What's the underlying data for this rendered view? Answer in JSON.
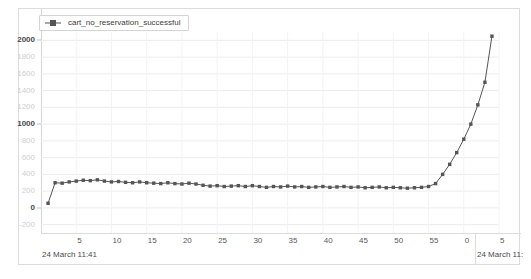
{
  "legend": {
    "position": "top-left",
    "entries": [
      {
        "label": "cart_no_reservation_successful",
        "color": "#555555",
        "marker": "square"
      }
    ]
  },
  "axes": {
    "y_ticks": [
      "2000",
      "1800",
      "1600",
      "1400",
      "1200",
      "1000",
      "800",
      "600",
      "400",
      "200",
      "0",
      "-200"
    ],
    "y_major_ticks": [
      "2000",
      "1000",
      "0"
    ],
    "x_ticks": [
      "5",
      "10",
      "15",
      "20",
      "25",
      "30",
      "35",
      "40",
      "45",
      "50",
      "55",
      "0",
      "5"
    ],
    "x_date_labels": [
      "24 March 11:41",
      "24 March 11:"
    ]
  },
  "chart_data": {
    "type": "line",
    "title": "",
    "xlabel": "",
    "ylabel": "",
    "ylim": [
      -300,
      2100
    ],
    "xlim": [
      0,
      65
    ],
    "grid": true,
    "legend_position": "top-left",
    "y_ticks": [
      2000,
      1800,
      1600,
      1400,
      1200,
      1000,
      800,
      600,
      400,
      200,
      0,
      -200
    ],
    "x_tick_values": [
      5,
      10,
      15,
      20,
      25,
      30,
      35,
      40,
      45,
      50,
      55,
      60,
      65
    ],
    "x_tick_labels": [
      "5",
      "10",
      "15",
      "20",
      "25",
      "30",
      "35",
      "40",
      "45",
      "50",
      "55",
      "0",
      "5"
    ],
    "x_axis_note": "seconds within minute; axis spans 24 March 11:41 into 24 March 11:42",
    "series": [
      {
        "name": "cart_no_reservation_successful",
        "color": "#555555",
        "marker": "square",
        "x": [
          1,
          2,
          3,
          4,
          5,
          6,
          7,
          8,
          9,
          10,
          11,
          12,
          13,
          14,
          15,
          16,
          17,
          18,
          19,
          20,
          21,
          22,
          23,
          24,
          25,
          26,
          27,
          28,
          29,
          30,
          31,
          32,
          33,
          34,
          35,
          36,
          37,
          38,
          39,
          40,
          41,
          42,
          43,
          44,
          45,
          46,
          47,
          48,
          49,
          50,
          51,
          52,
          53,
          54,
          55,
          56,
          57,
          58,
          59,
          60,
          61,
          62,
          63,
          64
        ],
        "values": [
          55,
          300,
          295,
          310,
          320,
          330,
          325,
          335,
          320,
          310,
          315,
          305,
          300,
          310,
          300,
          295,
          290,
          300,
          290,
          285,
          295,
          285,
          270,
          260,
          265,
          255,
          260,
          265,
          255,
          265,
          255,
          245,
          255,
          250,
          260,
          250,
          255,
          245,
          250,
          255,
          245,
          250,
          255,
          245,
          250,
          240,
          245,
          250,
          240,
          245,
          240,
          235,
          240,
          245,
          255,
          290,
          400,
          520,
          660,
          820,
          1000,
          1230,
          1500,
          2050
        ]
      }
    ]
  }
}
